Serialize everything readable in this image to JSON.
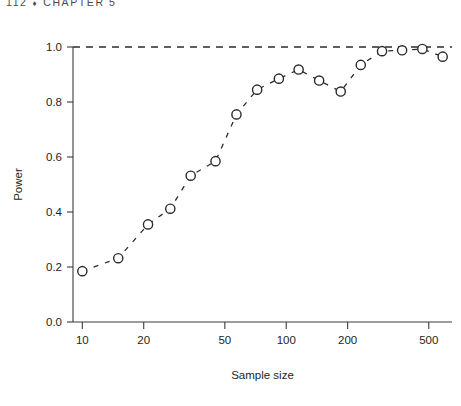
{
  "running_head": {
    "page_number": "112",
    "diamond": "♦",
    "chapter": "CHAPTER 5"
  },
  "chart_data": {
    "type": "scatter",
    "title": "",
    "xlabel": "Sample size",
    "ylabel": "Power",
    "x_scale": "log",
    "x_tick_values": [
      10,
      20,
      50,
      100,
      200,
      500
    ],
    "x_tick_labels": [
      "10",
      "20",
      "50",
      "100",
      "200",
      "500"
    ],
    "xlim": [
      9,
      650
    ],
    "y_tick_values": [
      0.0,
      0.2,
      0.4,
      0.6,
      0.8,
      1.0
    ],
    "y_tick_labels": [
      "0.0",
      "0.2",
      "0.4",
      "0.6",
      "0.8",
      "1.0"
    ],
    "ylim": [
      0.0,
      1.0
    ],
    "grid": false,
    "legend": "none",
    "marker": "open-circle",
    "line_style": "dashed",
    "reference_line": {
      "orientation": "horizontal",
      "y": 1.0,
      "style": "dashed"
    },
    "x": [
      10,
      15,
      21,
      27,
      34,
      45,
      57,
      72,
      92,
      115,
      145,
      185,
      232,
      295,
      370,
      465,
      585
    ],
    "values": [
      0.185,
      0.232,
      0.355,
      0.412,
      0.532,
      0.585,
      0.755,
      0.845,
      0.885,
      0.918,
      0.878,
      0.838,
      0.935,
      0.985,
      0.988,
      0.993,
      0.965
    ],
    "series": [
      {
        "name": "Power curve",
        "values": [
          0.185,
          0.232,
          0.355,
          0.412,
          0.532,
          0.585,
          0.755,
          0.845,
          0.885,
          0.918,
          0.878,
          0.838,
          0.935,
          0.985,
          0.988,
          0.993,
          0.965
        ]
      }
    ]
  }
}
